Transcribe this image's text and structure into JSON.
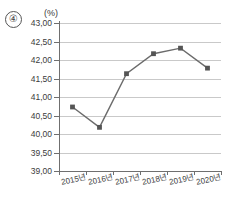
{
  "option": {
    "mark": "④"
  },
  "chart_data": {
    "type": "line",
    "title": "",
    "subtitle": "",
    "unit_label": "(%)",
    "xlabel": "",
    "ylabel": "",
    "categories": [
      "2015년",
      "2016년",
      "2017년",
      "2018년",
      "2019년",
      "2020년"
    ],
    "values": [
      40.73,
      40.18,
      41.63,
      42.17,
      42.32,
      41.78
    ],
    "series": [
      {
        "name": "비율",
        "values": [
          40.73,
          40.18,
          41.63,
          42.17,
          42.32,
          41.78
        ]
      }
    ],
    "ylim": [
      39.0,
      43.0
    ],
    "ytick_values": [
      43.0,
      42.5,
      42.0,
      41.5,
      41.0,
      40.5,
      40.0,
      39.5,
      39.0
    ],
    "ytick_labels": [
      "43,00",
      "42,50",
      "42,00",
      "41,50",
      "41,00",
      "40,50",
      "40,00",
      "39,50",
      "39,00"
    ],
    "grid": true,
    "legend": false,
    "legend_position": "none",
    "markers": "square",
    "decimal_separator": ",",
    "line_color": "#6b6b6b",
    "marker_color": "#555555",
    "grid_color": "#c9c9c9",
    "axis_color": "#6f6f6f"
  }
}
